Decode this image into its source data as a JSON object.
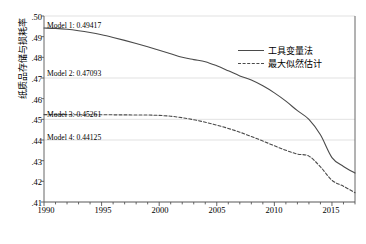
{
  "chart_data": {
    "type": "line",
    "title": "",
    "xlabel": "",
    "ylabel": "纸质品存储与损耗率",
    "xlim": [
      1990,
      2017
    ],
    "ylim": [
      0.41,
      0.5
    ],
    "grid": true,
    "legend_position": "top-right",
    "xticks": [
      "1990",
      "1995",
      "2000",
      "2005",
      "2010",
      "2015"
    ],
    "xtick_values": [
      1990,
      1995,
      2000,
      2005,
      2010,
      2015
    ],
    "yticks": [
      ".50",
      ".49",
      ".48",
      ".47",
      ".46",
      ".45",
      ".44",
      ".43",
      ".42",
      ".41"
    ],
    "ytick_values": [
      0.5,
      0.49,
      0.48,
      0.47,
      0.46,
      0.45,
      0.44,
      0.43,
      0.42,
      0.41
    ],
    "gridlines_at": [
      0.5,
      0.47,
      0.45,
      0.44,
      0.41
    ],
    "x": [
      1990,
      1991,
      1992,
      1993,
      1994,
      1995,
      1996,
      1997,
      1998,
      1999,
      2000,
      2001,
      2002,
      2003,
      2004,
      2005,
      2006,
      2007,
      2008,
      2009,
      2010,
      2011,
      2012,
      2013,
      2014,
      2015,
      2016,
      2017
    ],
    "series": [
      {
        "name": "工具变量法",
        "style": "solid",
        "color": "#4a4a4a",
        "values": [
          0.49417,
          0.494,
          0.4936,
          0.4929,
          0.492,
          0.4909,
          0.4896,
          0.4882,
          0.4867,
          0.4851,
          0.4834,
          0.4817,
          0.48,
          0.4789,
          0.4779,
          0.4759,
          0.4735,
          0.471,
          0.469,
          0.4662,
          0.4628,
          0.4588,
          0.4542,
          0.45,
          0.4425,
          0.4315,
          0.4272,
          0.424
        ]
      },
      {
        "name": "最大似然估计",
        "style": "dashed",
        "color": "#4a4a4a",
        "values": [
          0.4523,
          0.45228,
          0.45226,
          0.45224,
          0.45222,
          0.4522,
          0.45218,
          0.45215,
          0.45212,
          0.45208,
          0.4519,
          0.4515,
          0.4508,
          0.4498,
          0.4486,
          0.4472,
          0.4456,
          0.4438,
          0.4417,
          0.4395,
          0.4372,
          0.435,
          0.4332,
          0.4322,
          0.427,
          0.4205,
          0.4176,
          0.4145
        ]
      }
    ],
    "annotations": [
      {
        "id": "model1",
        "text": "Model 1: 0.49417",
        "value": 0.49417,
        "x": 1990.3,
        "y_anchor": 0.49417
      },
      {
        "id": "model2",
        "text": "Model 2: 0.47093",
        "value": 0.47093,
        "x": 1990.3,
        "y_anchor": 0.47093
      },
      {
        "id": "model3",
        "text": "Model 3: 0.45261",
        "value": 0.45261,
        "x": 1990.3,
        "y_anchor": 0.45261
      },
      {
        "id": "model4",
        "text": "Model 4: 0.44125",
        "value": 0.44125,
        "x": 1990.3,
        "y_anchor": 0.44125
      }
    ]
  },
  "caption": {
    "text": ""
  }
}
